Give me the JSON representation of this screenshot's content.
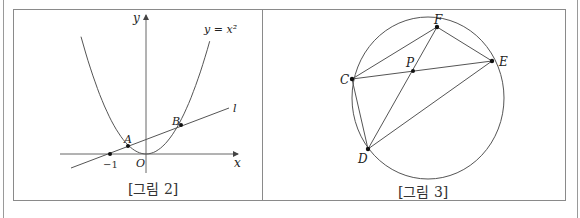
{
  "figure2": {
    "caption": "[그림 2]",
    "curve_label": "y = x²",
    "line_label": "l",
    "axis_x_label": "x",
    "axis_y_label": "y",
    "origin_label": "O",
    "tick_label": "−1",
    "point_a_label": "A",
    "point_b_label": "B"
  },
  "figure3": {
    "caption": "[그림 3]",
    "points": {
      "C": "C",
      "D": "D",
      "E": "E",
      "F": "F",
      "P": "P"
    }
  }
}
